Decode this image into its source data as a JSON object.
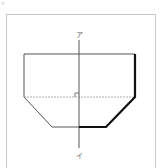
{
  "corner_mark": "ν",
  "diagram": {
    "axis_top_label": "ア",
    "axis_bottom_label": "イ",
    "colors": {
      "frame": "#c9c9c9",
      "thin_line": "#555555",
      "thick_line": "#111111",
      "dashed_line": "#9a9a9a",
      "axis": "#555555"
    },
    "shape": {
      "description": "Hexagonal figure (rectangle on top of an isosceles trapezoid) with a vertical symmetry axis; right half outline partly drawn in bold",
      "vertices": [
        [
          24,
          54
        ],
        [
          135,
          54
        ],
        [
          135,
          97
        ],
        [
          106,
          127
        ],
        [
          52,
          127
        ],
        [
          24,
          97
        ]
      ],
      "dashed_midline": [
        [
          24,
          97
        ],
        [
          135,
          97
        ]
      ],
      "bold_segments": [
        [
          [
            135,
            54
          ],
          [
            135,
            97
          ]
        ],
        [
          [
            135,
            97
          ],
          [
            106,
            127
          ]
        ],
        [
          [
            106,
            127
          ],
          [
            79,
            127
          ]
        ]
      ],
      "axis": [
        [
          79,
          40
        ],
        [
          79,
          148
        ]
      ],
      "right_angle_mark": {
        "x": 75,
        "y": 93,
        "size": 4
      }
    }
  }
}
